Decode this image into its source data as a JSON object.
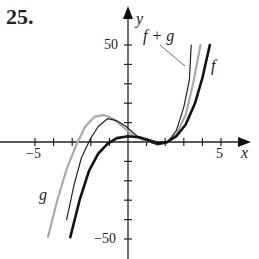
{
  "problem_number": "25.",
  "chart_data": {
    "type": "line",
    "title": "",
    "xlabel": "x",
    "ylabel": "y",
    "xlim": [
      -6,
      6.5
    ],
    "ylim": [
      -55,
      60
    ],
    "x_tick_step": 1,
    "y_tick_step": 10,
    "x_tick_labels": [
      "-5",
      "5"
    ],
    "y_tick_labels": [
      "50",
      "-50"
    ],
    "grid": false,
    "series": [
      {
        "name": "g",
        "color": "#aaaaaa",
        "width": 2.2,
        "points": [
          [
            -4.3,
            -49
          ],
          [
            -3.8,
            -30
          ],
          [
            -3.3,
            -14
          ],
          [
            -2.8,
            -2
          ],
          [
            -2.3,
            8
          ],
          [
            -1.8,
            13
          ],
          [
            -1.3,
            14
          ],
          [
            -0.8,
            12
          ],
          [
            -0.3,
            8
          ],
          [
            0.3,
            3
          ],
          [
            1,
            0.5
          ],
          [
            1.6,
            -1
          ],
          [
            2.1,
            0
          ],
          [
            2.6,
            4
          ],
          [
            3.1,
            14
          ],
          [
            3.5,
            30
          ],
          [
            3.9,
            50
          ]
        ]
      },
      {
        "name": "f + g",
        "color": "#222222",
        "width": 1.2,
        "points": [
          [
            -3.3,
            -40
          ],
          [
            -2.9,
            -22
          ],
          [
            -2.5,
            -8
          ],
          [
            -2.0,
            2
          ],
          [
            -1.6,
            8
          ],
          [
            -1.1,
            12
          ],
          [
            -0.6,
            11
          ],
          [
            -0.1,
            8
          ],
          [
            0.5,
            3
          ],
          [
            1,
            0.5
          ],
          [
            1.6,
            -1.5
          ],
          [
            2.1,
            -0.5
          ],
          [
            2.6,
            6
          ],
          [
            3,
            18
          ],
          [
            3.3,
            32
          ],
          [
            3.4,
            50
          ]
        ]
      },
      {
        "name": "f",
        "color": "#111111",
        "width": 2.6,
        "points": [
          [
            -3.1,
            -49
          ],
          [
            -2.6,
            -30
          ],
          [
            -2.1,
            -15
          ],
          [
            -1.6,
            -6
          ],
          [
            -1.1,
            -1
          ],
          [
            -0.6,
            2
          ],
          [
            0,
            3
          ],
          [
            0.6,
            2.5
          ],
          [
            1.1,
            1
          ],
          [
            1.6,
            -0.5
          ],
          [
            2.1,
            0
          ],
          [
            2.6,
            3
          ],
          [
            3.1,
            9
          ],
          [
            3.6,
            20
          ],
          [
            4.0,
            33
          ],
          [
            4.4,
            50
          ]
        ]
      }
    ],
    "annotations": [
      {
        "text": "f + g",
        "x": 2.1,
        "y": 55
      },
      {
        "text": "f",
        "x": 4.6,
        "y": 40
      },
      {
        "text": "g",
        "x": -5.3,
        "y": -27
      }
    ]
  },
  "labels": {
    "x_axis": "x",
    "y_axis": "y",
    "x_neg": "−5",
    "x_pos": "5",
    "y_pos": "50",
    "y_neg": "−50",
    "fg": "f + g",
    "f": "f",
    "g": "g"
  }
}
